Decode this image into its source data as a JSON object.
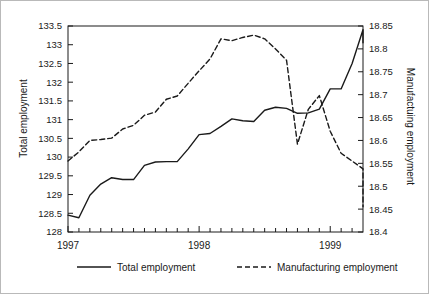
{
  "chart_data": {
    "type": "line",
    "title": "",
    "xlabel": "",
    "ylabel": "Total employment",
    "ylabel_right": "Manufactuing employment",
    "grid": false,
    "legend_position": "bottom",
    "x_tick_labels": [
      "1997",
      "1998",
      "1999"
    ],
    "x_tick_values": [
      1997,
      1998,
      1999
    ],
    "x_minor_ticks_per_year": 12,
    "xlim": [
      1997,
      1999.25
    ],
    "left_axis": {
      "label": "Total employment",
      "ylim": [
        128,
        133.5
      ],
      "tick_step": 0.5,
      "tick_labels": [
        "128",
        "128.5",
        "129",
        "129.5",
        "130",
        "130.5",
        "131",
        "131.5",
        "132",
        "132.5",
        "133",
        "133.5"
      ],
      "tick_values": [
        128,
        128.5,
        129,
        129.5,
        130,
        130.5,
        131,
        131.5,
        132,
        132.5,
        133,
        133.5
      ]
    },
    "right_axis": {
      "label": "Manufactuing employment",
      "ylim": [
        18.4,
        18.85
      ],
      "tick_step": 0.05,
      "tick_labels": [
        "18.4",
        "18.45",
        "18.5",
        "18.55",
        "18.6",
        "18.65",
        "18.7",
        "18.75",
        "18.8",
        "18.85"
      ],
      "tick_values": [
        18.4,
        18.45,
        18.5,
        18.55,
        18.6,
        18.65,
        18.7,
        18.75,
        18.8,
        18.85
      ]
    },
    "series": [
      {
        "name": "Total employment",
        "axis": "left",
        "style": "solid",
        "color": "#1a1a1a",
        "x": [
          1997.0,
          1997.083,
          1997.167,
          1997.25,
          1997.333,
          1997.417,
          1997.5,
          1997.583,
          1997.667,
          1997.75,
          1997.833,
          1997.917,
          1998.0,
          1998.083,
          1998.167,
          1998.25,
          1998.333,
          1998.417,
          1998.5,
          1998.583,
          1998.667,
          1998.75,
          1998.833,
          1998.917,
          1999.0,
          1999.083,
          1999.167,
          1999.25
        ],
        "values": [
          128.45,
          128.38,
          128.98,
          129.28,
          129.45,
          129.4,
          129.4,
          129.78,
          129.87,
          129.88,
          129.88,
          130.22,
          130.6,
          130.63,
          130.82,
          131.02,
          130.97,
          130.95,
          131.25,
          131.33,
          131.3,
          131.17,
          131.18,
          131.28,
          131.82,
          131.82,
          132.5,
          133.4
        ]
      },
      {
        "name": "Manufacturing employment",
        "axis": "right",
        "style": "dashed",
        "color": "#1a1a1a",
        "x": [
          1997.0,
          1997.083,
          1997.167,
          1997.25,
          1997.333,
          1997.417,
          1997.5,
          1997.583,
          1997.667,
          1997.75,
          1997.833,
          1997.917,
          1998.0,
          1998.083,
          1998.167,
          1998.25,
          1998.333,
          1998.417,
          1998.5,
          1998.583,
          1998.667,
          1998.75,
          1998.833,
          1998.917,
          1999.0,
          1999.083,
          1999.167,
          1999.25
        ],
        "values": [
          18.555,
          18.575,
          18.6,
          18.602,
          18.605,
          18.625,
          18.633,
          18.655,
          18.662,
          18.69,
          18.697,
          18.725,
          18.752,
          18.778,
          18.822,
          18.818,
          18.825,
          18.83,
          18.822,
          18.8,
          18.775,
          18.592,
          18.668,
          18.698,
          18.62,
          18.572,
          18.555,
          18.538
        ]
      }
    ],
    "annotations": [],
    "series_tail": {
      "total_employment_end": [
        133.4,
        133.15,
        133.05
      ],
      "manufacturing_end": [
        18.49,
        18.455
      ]
    }
  },
  "legend": {
    "entries": [
      {
        "label": "Total employment",
        "style": "solid"
      },
      {
        "label": "Manufacturing employment",
        "style": "dashed"
      }
    ]
  }
}
